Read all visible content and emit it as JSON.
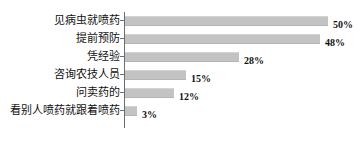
{
  "chart_data": {
    "type": "bar",
    "orientation": "horizontal",
    "title": "",
    "subtitle": "",
    "xlabel": "",
    "ylabel": "",
    "grid": false,
    "legend": false,
    "xlim": [
      0,
      50
    ],
    "value_suffix": "%",
    "categories": [
      "见病虫就喷药",
      "提前预防",
      "凭经验",
      "咨询农技人员",
      "问卖药的",
      "看别人喷药就跟着喷药"
    ],
    "values": [
      50,
      48,
      28,
      15,
      12,
      3
    ],
    "value_labels": [
      "50%",
      "48%",
      "28%",
      "15%",
      "12%",
      "3%"
    ],
    "bar_color": "#c3c3c3",
    "axis_color": "#6d6d6d",
    "background": "#ffffff"
  },
  "bars": [
    {
      "label": "见病虫就喷药",
      "value": 50,
      "value_label": "50%",
      "width_px": 203
    },
    {
      "label": "提前预防",
      "value": 48,
      "value_label": "48%",
      "width_px": 195
    },
    {
      "label": "凭经验",
      "value": 28,
      "value_label": "28%",
      "width_px": 114
    },
    {
      "label": "咨询农技人员",
      "value": 15,
      "value_label": "15%",
      "width_px": 61
    },
    {
      "label": "问卖药的",
      "value": 12,
      "value_label": "12%",
      "width_px": 49
    },
    {
      "label": "看别人喷药就跟着喷药",
      "value": 3,
      "value_label": "3%",
      "width_px": 12
    }
  ]
}
